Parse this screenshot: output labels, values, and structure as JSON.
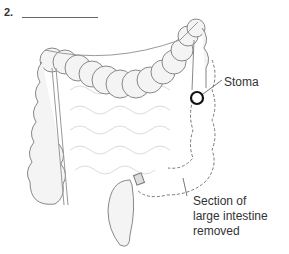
{
  "question": {
    "number": "2.",
    "answer_blank": ""
  },
  "labels": {
    "stoma": "Stoma",
    "section_line1": "Section of",
    "section_line2": "large intestine",
    "section_line3": "removed"
  },
  "colors": {
    "outline": "#777777",
    "stoma": "#111111",
    "fill": "#f2f2f2",
    "text": "#333333"
  }
}
